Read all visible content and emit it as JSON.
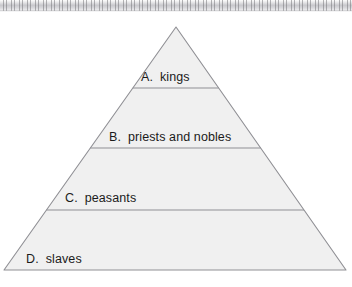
{
  "page": {
    "background_color": "#ffffff",
    "scan_edge_color": "#c9c9cd"
  },
  "diagram": {
    "name": "social-hierarchy-pyramid",
    "shape": "triangle",
    "fill_color": "#f0f0f0",
    "stroke_color": "#8f8f94",
    "apex": {
      "x": 176,
      "y": 27
    },
    "base_left": {
      "x": 4,
      "y": 270
    },
    "base_right": {
      "x": 346,
      "y": 270
    },
    "divider_y": [
      88,
      148,
      210
    ],
    "tiers": [
      {
        "letter": "A.",
        "label": "kings"
      },
      {
        "letter": "B.",
        "label": "priests  and nobles"
      },
      {
        "letter": "C.",
        "label": "peasants"
      },
      {
        "letter": "D.",
        "label": "slaves"
      }
    ]
  },
  "chart_data": {
    "type": "pie",
    "title": "",
    "xlabel": "",
    "ylabel": "",
    "categories": [
      "kings",
      "priests and nobles",
      "peasants",
      "slaves"
    ],
    "values": [
      1,
      2,
      3,
      4
    ],
    "legend_position": "none",
    "grid": false
  }
}
